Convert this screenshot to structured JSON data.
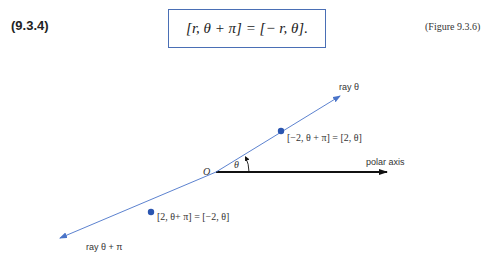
{
  "equation": {
    "number": "(9.3.4)",
    "text": "[r, θ + π] = [− r, θ].",
    "figure_ref": "(Figure 9.3.6)",
    "box_color": "#4a6fb5"
  },
  "figure": {
    "origin_label": "O",
    "angle_label": "θ",
    "polar_axis_label": "polar axis",
    "ray_theta_label": "ray θ",
    "ray_theta_pi_label": "ray θ + π",
    "point_upper_label": "[−2, θ + π] = [2,  θ]",
    "point_lower_label": "[2,  θ+ π] = [−2,  θ]",
    "ray_color": "#4a74c9",
    "point_color": "#2a55b0",
    "axis_color": "#111111"
  }
}
